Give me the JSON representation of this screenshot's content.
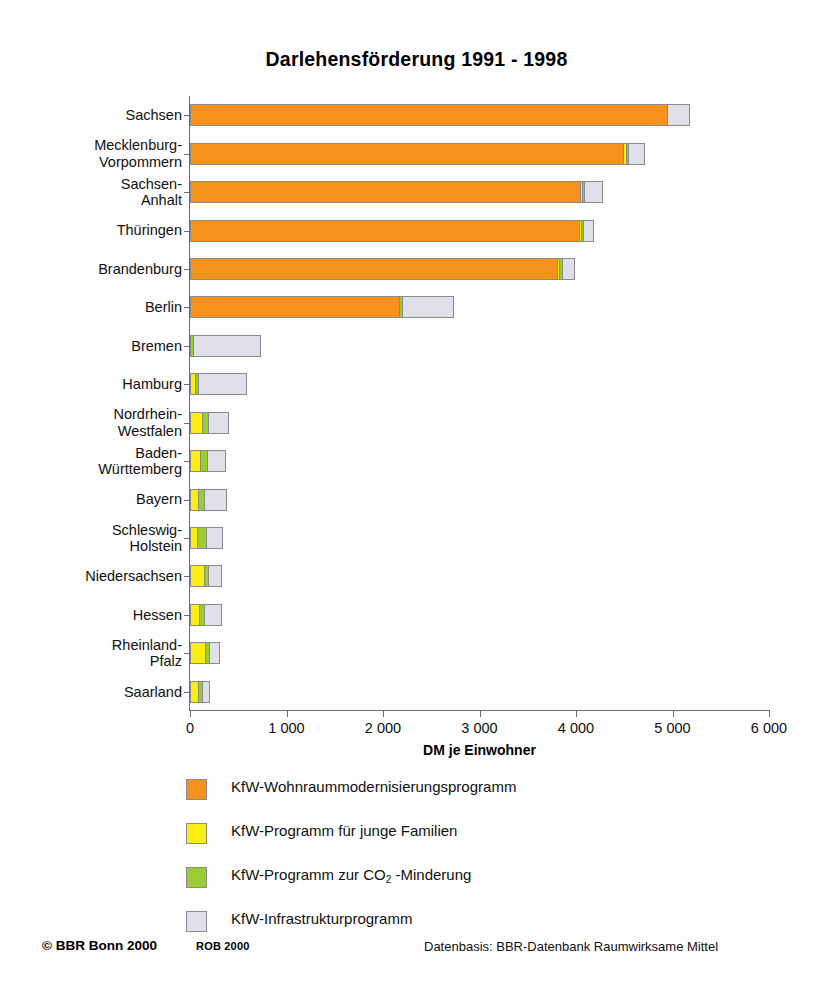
{
  "chart_data": {
    "type": "bar",
    "orientation": "horizontal",
    "stacked": true,
    "title": "Darlehensförderung 1991 - 1998",
    "xlabel": "DM je Einwohner",
    "ylabel": "",
    "xlim": [
      0,
      6000
    ],
    "xticks": [
      0,
      1000,
      2000,
      3000,
      4000,
      5000,
      6000
    ],
    "xticklabels": [
      "0",
      "1 000",
      "2 000",
      "3 000",
      "4 000",
      "5 000",
      "6 000"
    ],
    "grid": false,
    "legend_position": "below",
    "categories": [
      "Sachsen",
      "Mecklenburg-\nVorpommern",
      "Sachsen-\nAnhalt",
      "Thüringen",
      "Brandenburg",
      "Berlin",
      "Bremen",
      "Hamburg",
      "Nordrhein-\nWestfalen",
      "Baden-\nWürttemberg",
      "Bayern",
      "Schleswig-\nHolstein",
      "Niedersachsen",
      "Hessen",
      "Rheinland-\nPfalz",
      "Saarland"
    ],
    "series": [
      {
        "name": "KfW-Wohnraummodernisierungsprogramm",
        "color": "#F6921E",
        "values": [
          4930,
          4480,
          4030,
          4020,
          3790,
          2160,
          0,
          0,
          0,
          0,
          0,
          0,
          0,
          0,
          0,
          0
        ]
      },
      {
        "name": "KfW-Programm für junge Familien",
        "color": "#FAEE14",
        "values": [
          0,
          25,
          20,
          20,
          25,
          0,
          0,
          45,
          115,
          95,
          75,
          60,
          130,
          85,
          145,
          75
        ]
      },
      {
        "name": "KfW-Programm zur CO2-Minderung",
        "color": "#9ACD32",
        "values": [
          0,
          20,
          20,
          20,
          25,
          30,
          25,
          30,
          65,
          70,
          60,
          100,
          45,
          55,
          40,
          35
        ]
      },
      {
        "name": "KfW-Infrastrukturprogramm",
        "color": "#E0E0EA",
        "values": [
          235,
          165,
          185,
          110,
          130,
          530,
          690,
          500,
          205,
          190,
          225,
          165,
          135,
          175,
          110,
          75
        ]
      }
    ],
    "totals": [
      5165,
      4690,
      4255,
      4170,
      3970,
      2720,
      715,
      575,
      385,
      355,
      360,
      325,
      310,
      315,
      295,
      185
    ]
  },
  "legend": {
    "items": [
      {
        "label": "KfW-Wohnraummodernisierungsprogramm",
        "color": "#F6921E",
        "sub": ""
      },
      {
        "label": "KfW-Programm für junge Familien",
        "color": "#FAEE14",
        "sub": ""
      },
      {
        "label_pre": "KfW-Programm zur CO",
        "sub": "2",
        "label_post": " -Minderung",
        "label": "KfW-Programm zur CO2 -Minderung",
        "color": "#9ACD32"
      },
      {
        "label": "KfW-Infrastrukturprogramm",
        "color": "#E0E0EA",
        "sub": ""
      }
    ]
  },
  "footer": {
    "copyright": "© BBR Bonn 2000",
    "rob": "ROB 2000",
    "datasource": "Datenbasis: BBR-Datenbank Raumwirksame Mittel"
  },
  "colors": {
    "orange": "#F6921E",
    "yellow": "#FAEE14",
    "green": "#9ACD32",
    "lavender": "#E0E0EA",
    "axis": "#6b6b6b",
    "text": "#111111"
  }
}
